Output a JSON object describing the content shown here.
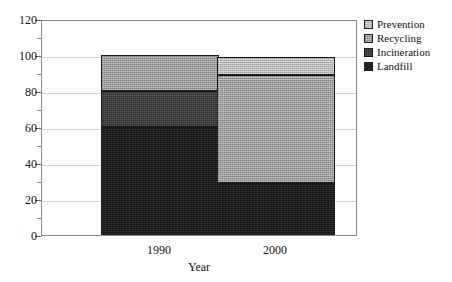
{
  "chart_data": {
    "type": "bar",
    "subtype": "stacked-bar",
    "title": "",
    "xlabel": "Year",
    "ylabel": "",
    "categories": [
      "1990",
      "2000"
    ],
    "ylim": [
      0,
      120
    ],
    "ytick_labels": [
      "0",
      "20",
      "40",
      "60",
      "80",
      "100",
      "120"
    ],
    "ytick_values": [
      0,
      20,
      40,
      60,
      80,
      100,
      120
    ],
    "yminor_values": [
      10,
      30,
      50,
      70,
      90,
      110
    ],
    "grid": true,
    "legend_position": "right",
    "series": [
      {
        "name": "Landfill",
        "values": [
          60,
          29
        ],
        "color": "#151515"
      },
      {
        "name": "Incineration",
        "values": [
          20,
          0
        ],
        "color": "#2f2f2f"
      },
      {
        "name": "Recycling",
        "values": [
          20,
          60
        ],
        "color": "#9a9a9a"
      },
      {
        "name": "Prevention",
        "values": [
          0,
          10
        ],
        "color": "#b6b6b6"
      }
    ],
    "stack_boundaries": {
      "1990": {
        "landfill": [
          0,
          60
        ],
        "incineration": [
          60,
          80
        ],
        "recycling": [
          80,
          100
        ],
        "prevention": [
          100,
          100
        ]
      },
      "2000": {
        "landfill": [
          0,
          29
        ],
        "incineration": [
          29,
          29
        ],
        "recycling": [
          29,
          89
        ],
        "prevention": [
          89,
          99
        ]
      }
    },
    "totals": [
      100,
      99
    ]
  },
  "legend": {
    "items": [
      {
        "label": "Prevention"
      },
      {
        "label": "Recycling"
      },
      {
        "label": "Incineration"
      },
      {
        "label": "Landfill"
      }
    ]
  },
  "axis": {
    "x_title": "Year"
  }
}
